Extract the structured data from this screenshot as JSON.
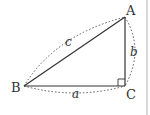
{
  "diagram": {
    "type": "right-triangle",
    "vertices": {
      "A": {
        "label": "A"
      },
      "B": {
        "label": "B"
      },
      "C": {
        "label": "C"
      }
    },
    "sides": {
      "a": {
        "label": "a",
        "between": [
          "B",
          "C"
        ]
      },
      "b": {
        "label": "b",
        "between": [
          "A",
          "C"
        ]
      },
      "c": {
        "label": "c",
        "between": [
          "B",
          "A"
        ]
      }
    },
    "right_angle_at": "C",
    "colors": {
      "stroke": "#333333",
      "dashed_arc": "#555555",
      "background": "#ffffff",
      "panel_border": "#d8d8d8"
    }
  }
}
